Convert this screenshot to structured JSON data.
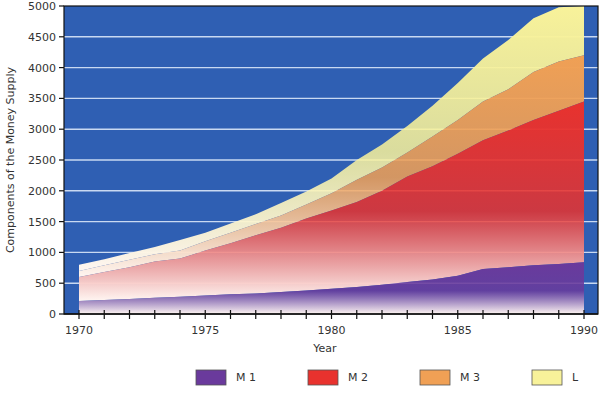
{
  "chart_data": {
    "type": "area",
    "stacked": true,
    "title": "",
    "xlabel": "Year",
    "ylabel": "Components of the Money Supply",
    "xlim": [
      1970,
      1990
    ],
    "ylim": [
      0,
      5000
    ],
    "x_ticks": [
      1970,
      1975,
      1980,
      1985,
      1990
    ],
    "y_ticks": [
      0,
      500,
      1000,
      1500,
      2000,
      2500,
      3000,
      3500,
      4000,
      4500,
      5000
    ],
    "grid": true,
    "legend_position": "bottom",
    "x": [
      1970,
      1971,
      1972,
      1973,
      1974,
      1975,
      1976,
      1977,
      1978,
      1979,
      1980,
      1981,
      1982,
      1983,
      1984,
      1985,
      1986,
      1987,
      1988,
      1989,
      1990
    ],
    "series": [
      {
        "name": "M 1",
        "color": "#6a3a9c",
        "cumulative": [
          210,
          225,
          245,
          265,
          280,
          300,
          320,
          335,
          355,
          380,
          410,
          440,
          475,
          520,
          560,
          620,
          730,
          760,
          790,
          810,
          840
        ]
      },
      {
        "name": "M 2",
        "color": "#e8322e",
        "cumulative": [
          600,
          680,
          760,
          850,
          900,
          1030,
          1150,
          1280,
          1400,
          1550,
          1680,
          1820,
          2000,
          2230,
          2400,
          2600,
          2820,
          2980,
          3150,
          3300,
          3450
        ]
      },
      {
        "name": "M 3",
        "color": "#f0a055",
        "cumulative": [
          700,
          790,
          880,
          970,
          1030,
          1180,
          1320,
          1460,
          1600,
          1780,
          1960,
          2180,
          2380,
          2620,
          2880,
          3150,
          3450,
          3650,
          3930,
          4100,
          4200
        ]
      },
      {
        "name": "L",
        "color": "#f8f29a",
        "cumulative": [
          800,
          890,
          990,
          1090,
          1200,
          1320,
          1470,
          1620,
          1800,
          1990,
          2200,
          2500,
          2750,
          3050,
          3380,
          3750,
          4150,
          4450,
          4800,
          4980,
          5000
        ]
      }
    ]
  },
  "colors": {
    "plot_background": "#2f5fb3",
    "grid": "#c9d9f2"
  }
}
